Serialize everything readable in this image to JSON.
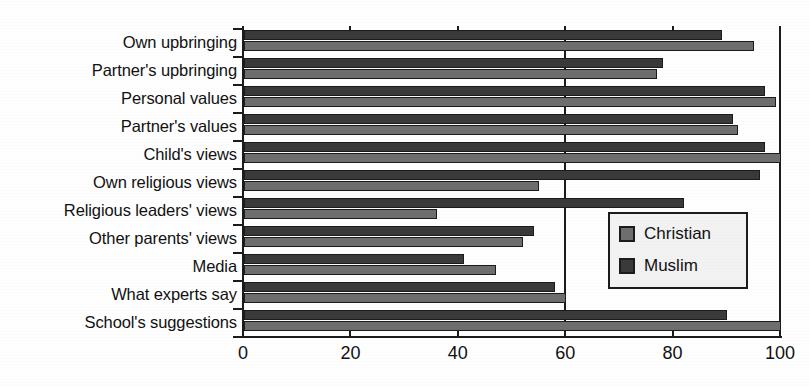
{
  "chart_data": {
    "type": "bar",
    "orientation": "horizontal",
    "title": "",
    "subtitle": "",
    "xlabel": "",
    "ylabel": "",
    "xlim": [
      0,
      100
    ],
    "xticks": [
      0,
      20,
      40,
      60,
      80,
      100
    ],
    "xticklabels": [
      "0",
      "20",
      "40",
      "60",
      "80",
      "100"
    ],
    "grid": false,
    "legend_position": "inside-lower-right",
    "categories": [
      "Own upbringing",
      "Partner's upbringing",
      "Personal values",
      "Partner's values",
      "Child's views",
      "Own religious views",
      "Religious leaders' views",
      "Other parents' views",
      "Media",
      "What experts say",
      "School's suggestions"
    ],
    "series": [
      {
        "name": "Muslim",
        "color": "#3a3a3a",
        "values": [
          89,
          78,
          97,
          91,
          97,
          96,
          82,
          54,
          41,
          58,
          90
        ]
      },
      {
        "name": "Christian",
        "color": "#6e6e6e",
        "values": [
          95,
          77,
          99,
          92,
          100,
          55,
          36,
          52,
          47,
          60,
          100
        ]
      }
    ]
  },
  "legend": {
    "entries": [
      {
        "label": "Christian",
        "color": "#6e6e6e"
      },
      {
        "label": "Muslim",
        "color": "#3a3a3a"
      }
    ]
  },
  "colors": {
    "axis": "#1b1b1b",
    "background": "#fefefe",
    "muslim": "#3a3a3a",
    "christian": "#6e6e6e"
  }
}
